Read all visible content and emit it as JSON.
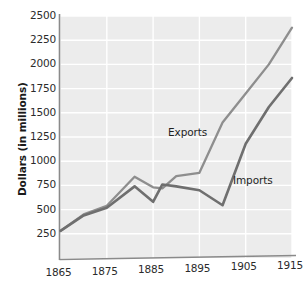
{
  "chart_data": {
    "type": "line",
    "title": "",
    "xlabel": "",
    "ylabel": "Dollars (in millions)",
    "xlim": [
      1865,
      1915
    ],
    "ylim": [
      0,
      2500
    ],
    "grid": true,
    "legend_position": "inline-labels",
    "x_ticks": [
      "1865",
      "1875",
      "1885",
      "1895",
      "1905",
      "1915"
    ],
    "y_ticks": [
      "250",
      "500",
      "750",
      "1000",
      "1250",
      "1500",
      "1750",
      "2000",
      "2250",
      "2500"
    ],
    "series": [
      {
        "name": "Exports",
        "color": "#8e8e8e",
        "x": [
          1865,
          1870,
          1875,
          1881,
          1885,
          1887,
          1890,
          1895,
          1900,
          1905,
          1910,
          1915
        ],
        "values": [
          280,
          450,
          540,
          840,
          730,
          720,
          845,
          880,
          1400,
          1700,
          2000,
          2380
        ]
      },
      {
        "name": "Imports",
        "color": "#6f6f6f",
        "x": [
          1865,
          1870,
          1875,
          1881,
          1885,
          1887,
          1890,
          1895,
          1900,
          1905,
          1910,
          1915
        ],
        "values": [
          280,
          440,
          520,
          740,
          580,
          760,
          740,
          700,
          545,
          1180,
          1560,
          1860
        ]
      }
    ],
    "annotations": [
      {
        "text": "Exports",
        "x_px": 168,
        "y_px": 126
      },
      {
        "text": "Imports",
        "x_px": 233,
        "y_px": 174
      }
    ]
  },
  "axis": {
    "y_title": "Dollars (in millions)"
  }
}
